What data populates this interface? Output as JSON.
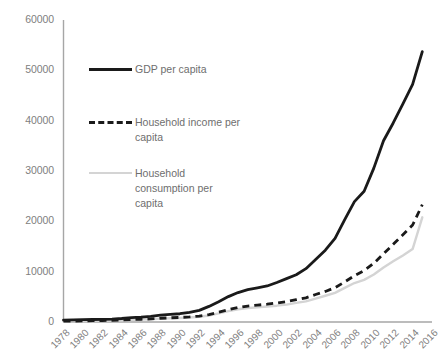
{
  "chart_data": {
    "type": "line",
    "title": "",
    "subtitle": "",
    "xlabel": "",
    "ylabel": "",
    "ylim": [
      0,
      60000
    ],
    "xlim": [
      1978,
      2016
    ],
    "grid": false,
    "legend_position": "inside-upper-left",
    "y_ticks": [
      "0",
      "10000",
      "20000",
      "30000",
      "40000",
      "50000",
      "60000"
    ],
    "x_ticks": [
      "1978",
      "1980",
      "1982",
      "1984",
      "1986",
      "1988",
      "1990",
      "1992",
      "1994",
      "1996",
      "1998",
      "2000",
      "2002",
      "2004",
      "2006",
      "2008",
      "2010",
      "2012",
      "2014",
      "2016"
    ],
    "x": [
      1978,
      1979,
      1980,
      1981,
      1982,
      1983,
      1984,
      1985,
      1986,
      1987,
      1988,
      1989,
      1990,
      1991,
      1992,
      1993,
      1994,
      1995,
      1996,
      1997,
      1998,
      1999,
      2000,
      2001,
      2002,
      2003,
      2004,
      2005,
      2006,
      2007,
      2008,
      2009,
      2010,
      2011,
      2012,
      2013,
      2014,
      2015
    ],
    "series": [
      {
        "name": "GDP per capita",
        "style": "solid",
        "color": "#1a1a1a",
        "values": [
          385,
          423,
          468,
          497,
          533,
          588,
          695,
          858,
          963,
          1112,
          1366,
          1519,
          1644,
          1893,
          2311,
          3098,
          4044,
          5046,
          5846,
          6420,
          6796,
          7159,
          7858,
          8622,
          9398,
          10600,
          12400,
          14259,
          16602,
          20337,
          23912,
          25963,
          30567,
          36018,
          39544,
          43320,
          47203,
          53700
        ],
        "endpoint_year": 2015,
        "endpoint_value": 53700
      },
      {
        "name": "Household income per capita",
        "style": "dashed",
        "color": "#1a1a1a",
        "values": [
          171,
          192,
          227,
          266,
          301,
          337,
          404,
          492,
          549,
          607,
          744,
          833,
          904,
          1010,
          1180,
          1469,
          1946,
          2440,
          2880,
          3175,
          3355,
          3540,
          3777,
          4060,
          4426,
          4804,
          5458,
          6072,
          6815,
          7960,
          9198,
          10216,
          11663,
          13557,
          15433,
          17322,
          19274,
          23300
        ],
        "endpoint_year": 2015,
        "endpoint_value": 23300
      },
      {
        "name": "Household consumption per capita",
        "style": "solid",
        "color": "#d4d4d4",
        "values": [
          151,
          170,
          200,
          234,
          260,
          292,
          348,
          437,
          485,
          539,
          662,
          732,
          797,
          885,
          1037,
          1299,
          1717,
          2164,
          2542,
          2778,
          2902,
          3070,
          3243,
          3459,
          3788,
          4100,
          4642,
          5211,
          5798,
          6793,
          7744,
          8377,
          9424,
          10820,
          12049,
          13226,
          14491,
          20800
        ],
        "endpoint_year": 2015,
        "endpoint_value": 20800
      }
    ]
  },
  "legend": {
    "items": [
      {
        "label": "GDP per capita",
        "marker": "solid-dark-line-icon"
      },
      {
        "label": "Household income per capita",
        "marker": "dashed-dark-line-icon"
      },
      {
        "label": "Household consumption per capita",
        "marker": "solid-light-line-icon"
      }
    ]
  },
  "colors": {
    "gdp": "#1a1a1a",
    "income": "#1a1a1a",
    "consumption": "#d4d4d4",
    "axis": "#a6a6a6",
    "tick_text": "#808080",
    "background": "#ffffff"
  }
}
